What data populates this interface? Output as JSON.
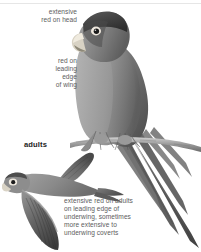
{
  "plate": {
    "title": "Parrot identification plate",
    "background_color": "#ffffff",
    "text_color": "#5d5d5d",
    "heading_color": "#1d1d1d"
  },
  "annotations": {
    "head": "extensive\nred on head",
    "wing": "red on\nleading\nedge\nof wing",
    "adults": "adults",
    "underwing": "extensive red on adults\non leading edge of\nunderwing, sometimes\nmore extensive to\nunderwing coverts"
  },
  "figures": {
    "perched": {
      "name": "perched parrot",
      "pose": "perched on branch, facing left, long pointed tail to lower right"
    },
    "flying": {
      "name": "flying parrot",
      "pose": "in flight, viewed from below, facing left, wings spread"
    }
  }
}
